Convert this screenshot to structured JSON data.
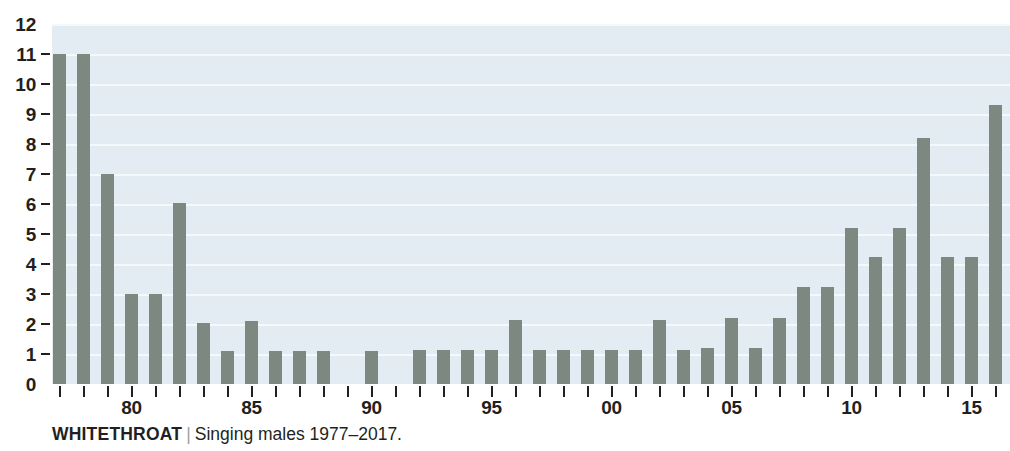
{
  "caption": {
    "species": "WHITETHROAT",
    "separator": "|",
    "description": "Singing males 1977–2017."
  },
  "colors": {
    "bar": "#7d8880",
    "plot_background": "#e3ecf2",
    "gridline": "#f4f9fb",
    "text": "#231f20",
    "page_background": "#ffffff"
  },
  "chart_data": {
    "type": "bar",
    "xlabel": "",
    "ylabel": "",
    "ylim": [
      0,
      12
    ],
    "ytick_labels": [
      "0",
      "1",
      "2",
      "3",
      "4",
      "5",
      "6",
      "7",
      "8",
      "9",
      "10",
      "11",
      "12"
    ],
    "ytick_values": [
      0,
      1,
      2,
      3,
      4,
      5,
      6,
      7,
      8,
      9,
      10,
      11,
      12
    ],
    "grid": true,
    "legend": "none",
    "xtick_labels": [
      "80",
      "85",
      "90",
      "95",
      "00",
      "05",
      "10",
      "15"
    ],
    "xtick_values": [
      1980,
      1985,
      1990,
      1995,
      2000,
      2005,
      2010,
      2015
    ],
    "categories": [
      1977,
      1978,
      1979,
      1980,
      1981,
      1982,
      1983,
      1984,
      1985,
      1986,
      1987,
      1988,
      1989,
      1990,
      1991,
      1992,
      1993,
      1994,
      1995,
      1996,
      1997,
      1998,
      1999,
      2000,
      2001,
      2002,
      2003,
      2004,
      2005,
      2006,
      2007,
      2008,
      2009,
      2010,
      2011,
      2012,
      2013,
      2014,
      2015,
      2016,
      2017
    ],
    "values": [
      11.0,
      11.0,
      7.0,
      3.0,
      3.0,
      6.05,
      2.05,
      1.1,
      2.1,
      1.1,
      1.1,
      1.1,
      0,
      1.1,
      0,
      1.15,
      1.15,
      1.15,
      1.15,
      2.15,
      1.15,
      1.15,
      1.15,
      1.15,
      1.15,
      2.15,
      1.15,
      1.2,
      2.2,
      1.2,
      2.2,
      3.25,
      3.25,
      5.2,
      4.25,
      5.2,
      8.2,
      4.25,
      4.25,
      9.3,
      11.3
    ]
  }
}
